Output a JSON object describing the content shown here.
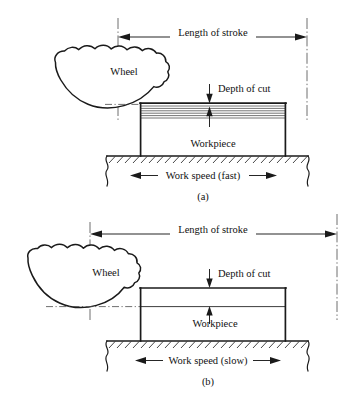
{
  "figure": {
    "background_color": "#ffffff",
    "line_color": "#1a1a1a",
    "panels": [
      {
        "id": "a",
        "caption": "(a)",
        "labels": {
          "length_of_stroke": "Length of stroke",
          "wheel": "Wheel",
          "depth_of_cut": "Depth of cut",
          "workpiece": "Workpiece",
          "work_speed": "Work speed (fast)"
        }
      },
      {
        "id": "b",
        "caption": "(b)",
        "labels": {
          "length_of_stroke": "Length of stroke",
          "wheel": "Wheel",
          "depth_of_cut": "Depth of cut",
          "workpiece": "Workpiece",
          "work_speed": "Work speed (slow)"
        }
      }
    ]
  }
}
